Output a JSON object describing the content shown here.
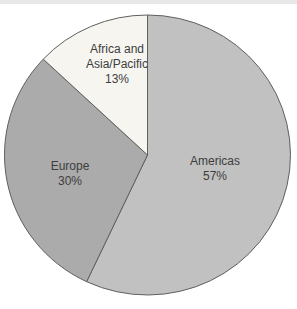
{
  "page": {
    "background": "#ffffff",
    "top_strip_color": "#e8e8e8"
  },
  "chart_data": {
    "type": "pie",
    "title": "",
    "direction": "clockwise",
    "start_angle_deg": 0,
    "outline_color": "#5f5f5f",
    "slices": [
      {
        "label": "Americas",
        "value": 57,
        "pct_label": "57%",
        "color": "#c1c1c1",
        "label_lines": [
          "Americas",
          "57%"
        ]
      },
      {
        "label": "Europe",
        "value": 30,
        "pct_label": "30%",
        "color": "#ababab",
        "label_lines": [
          "Europe",
          "30%"
        ]
      },
      {
        "label": "Africa and Asia/Pacific",
        "value": 13,
        "pct_label": "13%",
        "color": "#f6f5f0",
        "label_lines": [
          "Africa and",
          "Asia/Pacific",
          "13%"
        ]
      }
    ]
  }
}
